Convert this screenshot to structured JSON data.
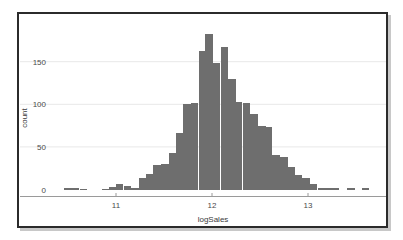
{
  "chart_data": {
    "type": "bar",
    "title": "",
    "subtitle": "",
    "xlabel": "logSales",
    "ylabel": "count",
    "xlim": [
      10.35,
      13.62
    ],
    "ylim": [
      0,
      190
    ],
    "grid": true,
    "grid_axis": "y",
    "legend": false,
    "legend_position": "none",
    "bar_color": "#6e6e6e",
    "gridline_color": "#e8e8e8",
    "axis_line_color": "#9a9a9a",
    "panel_background": "#ffffff",
    "bin_width": 0.0775,
    "x_tick_labels": [
      "11",
      "12",
      "13"
    ],
    "x_ticks": [
      11,
      12,
      13
    ],
    "y_tick_labels": [
      "0",
      "50",
      "100",
      "150"
    ],
    "y_ticks": [
      0,
      50,
      100,
      150
    ],
    "note": "Histogram of logSales; x values are bin left edges",
    "x": [
      10.38,
      10.46,
      10.54,
      10.62,
      10.69,
      10.77,
      10.85,
      10.93,
      11.0,
      11.08,
      11.16,
      11.24,
      11.31,
      11.39,
      11.47,
      11.55,
      11.62,
      11.7,
      11.78,
      11.86,
      11.93,
      12.01,
      12.09,
      12.17,
      12.24,
      12.32,
      12.4,
      12.48,
      12.55,
      12.63,
      12.71,
      12.79,
      12.86,
      12.94,
      13.02,
      13.1,
      13.17,
      13.25,
      13.33,
      13.41,
      13.48,
      13.56
    ],
    "values": [
      0,
      2,
      2,
      1,
      0,
      0,
      1,
      3,
      6,
      4,
      2,
      13,
      18,
      29,
      30,
      43,
      66,
      100,
      102,
      163,
      183,
      148,
      167,
      130,
      103,
      101,
      89,
      74,
      73,
      40,
      38,
      26,
      17,
      13,
      6,
      2,
      2,
      2,
      0,
      2,
      0,
      2
    ]
  },
  "figure": {
    "frame_border_color": "#2b2b2b",
    "shadow_color": "#c8c8c8"
  }
}
